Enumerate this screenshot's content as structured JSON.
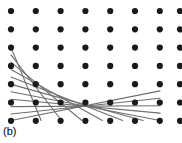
{
  "figure": {
    "caption": "(b)",
    "width": 182,
    "height": 143,
    "background_color": "#ffffff"
  },
  "chart_data": {
    "type": "scatter",
    "title": "",
    "subtitle": "",
    "xlabel": "",
    "ylabel": "",
    "annotations": [
      "(b)"
    ],
    "grid": false,
    "legend_position": "none",
    "lattice": {
      "rows": 7,
      "columns": 7,
      "partial_column_at_right_edge": true,
      "origin_x": 11,
      "origin_y": 11,
      "spacing_x": 24.8,
      "spacing_y": 18.3,
      "dot_radius": 3.1,
      "dot_color": "#1a1a1a"
    },
    "lines": {
      "count": 11,
      "color": "#6e6e6e",
      "width": 1.1,
      "slope_rows_per_column": -0.5,
      "style": "solid",
      "segments": [
        {
          "x1": 11,
          "y1": 47.4,
          "x2": 41.1,
          "y2": 120.5
        },
        {
          "x1": 11,
          "y1": 54.8,
          "x2": 61.5,
          "y2": 120.5
        },
        {
          "x1": 11,
          "y1": 62.2,
          "x2": 81.9,
          "y2": 120.5
        },
        {
          "x1": 11,
          "y1": 69.6,
          "x2": 102.3,
          "y2": 120.5
        },
        {
          "x1": 11,
          "y1": 77.0,
          "x2": 122.7,
          "y2": 120.5
        },
        {
          "x1": 11,
          "y1": 84.4,
          "x2": 143.1,
          "y2": 120.5
        },
        {
          "x1": 11,
          "y1": 91.8,
          "x2": 160.0,
          "y2": 120.5
        },
        {
          "x1": 11,
          "y1": 99.2,
          "x2": 160.0,
          "y2": 113.1
        },
        {
          "x1": 11,
          "y1": 106.6,
          "x2": 160.0,
          "y2": 105.7
        },
        {
          "x1": 11,
          "y1": 114.0,
          "x2": 160.0,
          "y2": 98.3
        },
        {
          "x1": 11,
          "y1": 120.5,
          "x2": 160.0,
          "y2": 90.9
        }
      ]
    },
    "x": [
      11,
      35.8,
      60.6,
      85.4,
      110.2,
      135,
      159.8,
      180
    ],
    "y": [
      11,
      29.3,
      47.6,
      65.9,
      84.2,
      102.5,
      120.8
    ]
  }
}
